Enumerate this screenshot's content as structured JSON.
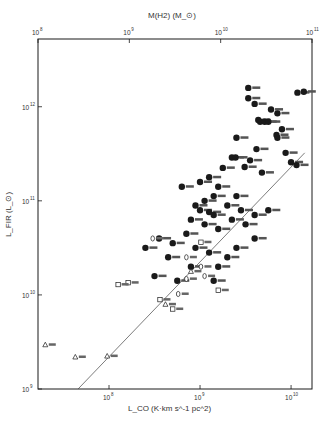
{
  "chart_data": {
    "type": "scatter",
    "title": "",
    "xlabel": "L_CO (K·km s^-1 pc^2)",
    "ylabel": "L_FIR (L_⊙)",
    "top_xlabel": "M(H2)   (M_⊙)",
    "x_scale": "log",
    "y_scale": "log",
    "xlim_log10": [
      7.22,
      10.23
    ],
    "ylim_log10": [
      9.0,
      12.72
    ],
    "top_xlim_log10": [
      8.0,
      11.0
    ],
    "x_tick_labels": [
      "10^8",
      "10^9",
      "10^10"
    ],
    "x_ticks_log10": [
      8,
      9,
      10
    ],
    "y_tick_labels": [
      "10^9",
      "10^10",
      "10^11",
      "10^12"
    ],
    "y_ticks_log10": [
      9,
      10,
      11,
      12
    ],
    "top_tick_labels": [
      "10^8",
      "10^9",
      "10^10",
      "10^11"
    ],
    "top_ticks_log10": [
      8,
      9,
      10,
      11
    ],
    "grid": false,
    "legend": null,
    "fit_line": {
      "x_log10": [
        7.66,
        10.15
      ],
      "y_log10": [
        9.0,
        11.51
      ]
    },
    "series": [
      {
        "name": "filled circles",
        "marker": "filled-circle",
        "points_log10": [
          [
            9.53,
            12.2
          ],
          [
            9.53,
            12.09
          ],
          [
            9.6,
            12.03
          ],
          [
            9.78,
            11.97
          ],
          [
            9.85,
            11.93
          ],
          [
            9.64,
            11.86
          ],
          [
            9.66,
            11.84
          ],
          [
            9.71,
            11.84
          ],
          [
            9.75,
            11.84
          ],
          [
            9.9,
            11.76
          ],
          [
            10.07,
            12.15
          ],
          [
            10.14,
            12.16
          ],
          [
            9.4,
            11.67
          ],
          [
            9.55,
            11.43
          ],
          [
            9.49,
            11.36
          ],
          [
            9.68,
            11.3
          ],
          [
            10.0,
            11.41
          ],
          [
            9.62,
            11.55
          ],
          [
            9.85,
            11.67
          ],
          [
            9.84,
            11.7
          ],
          [
            9.35,
            11.46
          ],
          [
            9.39,
            11.46
          ],
          [
            9.94,
            11.51
          ],
          [
            10.06,
            11.38
          ],
          [
            9.1,
            11.25
          ],
          [
            9.2,
            11.15
          ],
          [
            9.15,
            11.05
          ],
          [
            9.05,
            11.0
          ],
          [
            8.95,
            10.95
          ],
          [
            9.0,
            10.9
          ],
          [
            9.1,
            10.88
          ],
          [
            9.15,
            10.85
          ],
          [
            8.9,
            10.8
          ],
          [
            9.05,
            10.75
          ],
          [
            9.2,
            10.7
          ],
          [
            8.85,
            10.65
          ],
          [
            9.3,
            10.95
          ],
          [
            9.4,
            11.05
          ],
          [
            9.45,
            10.9
          ],
          [
            9.35,
            10.8
          ],
          [
            9.5,
            10.75
          ],
          [
            9.6,
            10.85
          ],
          [
            9.25,
            11.35
          ],
          [
            9.0,
            11.2
          ],
          [
            8.8,
            11.15
          ],
          [
            8.7,
            10.55
          ],
          [
            8.95,
            10.5
          ],
          [
            9.1,
            10.45
          ],
          [
            8.55,
            10.6
          ],
          [
            8.4,
            10.5
          ],
          [
            8.65,
            10.4
          ],
          [
            8.9,
            10.3
          ],
          [
            9.3,
            10.4
          ],
          [
            9.2,
            10.3
          ],
          [
            8.5,
            10.2
          ],
          [
            8.75,
            10.15
          ],
          [
            9.15,
            10.15
          ],
          [
            9.4,
            10.5
          ],
          [
            9.6,
            10.6
          ],
          [
            9.75,
            10.9
          ]
        ]
      },
      {
        "name": "open circles",
        "marker": "open-circle",
        "points_log10": [
          [
            8.48,
            10.6
          ],
          [
            9.01,
            10.3
          ],
          [
            8.85,
            10.17
          ],
          [
            8.76,
            10.01
          ],
          [
            8.85,
            10.4
          ],
          [
            9.05,
            10.2
          ]
        ]
      },
      {
        "name": "open squares",
        "marker": "open-square",
        "points_log10": [
          [
            8.21,
            10.13
          ],
          [
            8.1,
            10.11
          ],
          [
            8.56,
            9.95
          ],
          [
            9.01,
            10.56
          ],
          [
            8.7,
            9.85
          ],
          [
            9.2,
            10.05
          ]
        ]
      },
      {
        "name": "open triangles",
        "marker": "open-triangle",
        "points_log10": [
          [
            7.3,
            9.47
          ],
          [
            7.63,
            9.34
          ],
          [
            7.98,
            9.35
          ],
          [
            8.62,
            9.9
          ],
          [
            8.9,
            10.25
          ]
        ]
      }
    ]
  },
  "colors": {
    "ink": "#1a1a1a",
    "background": "#ffffff"
  }
}
